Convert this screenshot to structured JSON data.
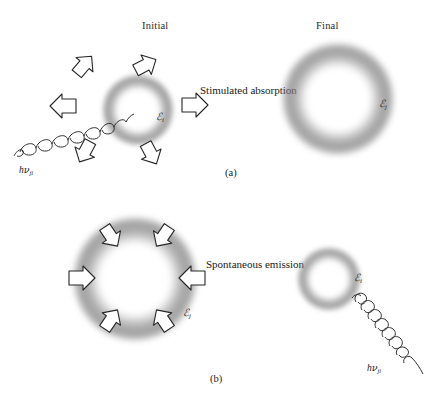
{
  "figure": {
    "type": "physics-diagram",
    "column_headings": {
      "initial": "Initial",
      "final": "Final"
    },
    "panels": [
      {
        "id": "a",
        "caption": "(a)",
        "process_label": "Stimulated absorption",
        "initial_state": {
          "energy_label_prefix": "ℰ",
          "energy_label_sub": "i",
          "orbital_size": "small",
          "arrow_direction": "outward",
          "arrow_count": 6
        },
        "final_state": {
          "energy_label_prefix": "ℰ",
          "energy_label_sub": "j",
          "orbital_size": "large",
          "arrow_direction": "none",
          "arrow_count": 0
        },
        "photon": {
          "label_h": "h",
          "label_nu": "ν",
          "label_sub": "ji",
          "direction": "incoming",
          "position": "lower-left"
        }
      },
      {
        "id": "b",
        "caption": "(b)",
        "process_label": "Spontaneous emission",
        "initial_state": {
          "energy_label_prefix": "ℰ",
          "energy_label_sub": "j",
          "orbital_size": "large",
          "arrow_direction": "inward",
          "arrow_count": 6
        },
        "final_state": {
          "energy_label_prefix": "ℰ",
          "energy_label_sub": "i",
          "orbital_size": "small",
          "arrow_direction": "none",
          "arrow_count": 0
        },
        "photon": {
          "label_h": "h",
          "label_nu": "ν",
          "label_sub": "ji",
          "direction": "outgoing",
          "position": "lower-right"
        }
      }
    ],
    "colors": {
      "background": "#ffffff",
      "ink": "#1a1a1a",
      "orbital_shell": "#787878",
      "arrow_fill": "#ffffff",
      "arrow_stroke": "#262626"
    }
  }
}
